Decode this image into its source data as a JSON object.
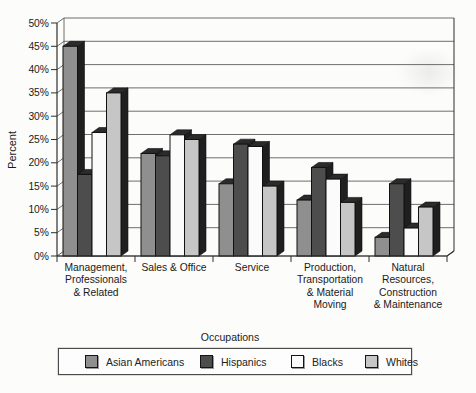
{
  "figure": {
    "background": "#fcfcfb"
  },
  "chart_data": {
    "type": "bar",
    "title": "",
    "xlabel": "Occupations",
    "ylabel": "Percent",
    "ylim": [
      0,
      50
    ],
    "ytick_step": 5,
    "ytick_suffix": "%",
    "grid": true,
    "pseudo_3d": true,
    "legend_position": "bottom",
    "categories": [
      "Management, Professionals & Related",
      "Sales & Office",
      "Service",
      "Production, Transportation & Material Moving",
      "Natural Resources, Construction & Maintenance"
    ],
    "category_label_lines": [
      [
        "Management,",
        "Professionals",
        "& Related"
      ],
      [
        "Sales & Office"
      ],
      [
        "Service"
      ],
      [
        "Production,",
        "Transportation",
        "& Material",
        "Moving"
      ],
      [
        "Natural",
        "Resources,",
        "Construction",
        "& Maintenance"
      ]
    ],
    "series": [
      {
        "name": "Asian Americans",
        "color": "#8f8f8f",
        "values": [
          45,
          22,
          15.5,
          12,
          4
        ]
      },
      {
        "name": "Hispanics",
        "color": "#4d4d4d",
        "values": [
          17.5,
          21.5,
          24,
          19,
          15.5
        ]
      },
      {
        "name": "Blacks",
        "color": "#fbfbfb",
        "values": [
          26.5,
          26,
          23.5,
          16.5,
          6
        ]
      },
      {
        "name": "Whites",
        "color": "#c6c6c6",
        "values": [
          35,
          25,
          15,
          11.5,
          10.5
        ]
      }
    ],
    "colors": {
      "extrusion_side": "#1f1f1f",
      "extrusion_top": "#2b2b2b",
      "bar_outline": "#111111",
      "gridline": "#4a4a4a",
      "axis": "#2e2e2e",
      "text": "#1a1a1a"
    }
  },
  "legend": {
    "items": [
      {
        "label": "Asian Americans",
        "color": "#8f8f8f"
      },
      {
        "label": "Hispanics",
        "color": "#4d4d4d"
      },
      {
        "label": "Blacks",
        "color": "#fbfbfb"
      },
      {
        "label": "Whites",
        "color": "#c6c6c6"
      }
    ]
  }
}
